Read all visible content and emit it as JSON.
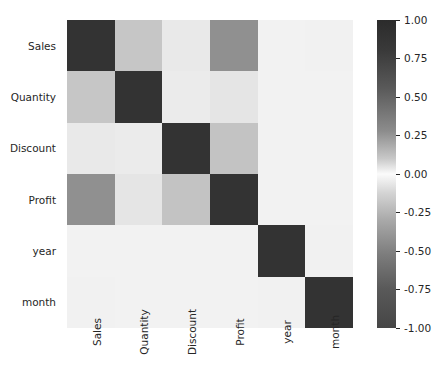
{
  "chart_data": {
    "type": "heatmap",
    "title": "",
    "xlabel": "",
    "ylabel": "",
    "categories": [
      "Sales",
      "Quantity",
      "Discount",
      "Profit",
      "year",
      "month"
    ],
    "x_tick_labels": [
      "Sales",
      "Quantity",
      "Discount",
      "Profit",
      "year",
      "month"
    ],
    "y_tick_labels": [
      "Sales",
      "Quantity",
      "Discount",
      "Profit",
      "year",
      "month"
    ],
    "colormap": "gray-diverging",
    "zlim": [
      -1.0,
      1.0
    ],
    "grid": false,
    "legend_position": "right",
    "colorbar": {
      "orientation": "vertical",
      "ticks": [
        "1.00",
        "0.75",
        "0.50",
        "0.25",
        "0.00",
        "-0.25",
        "-0.50",
        "-0.75",
        "-1.00"
      ],
      "tick_values": [
        1.0,
        0.75,
        0.5,
        0.25,
        0.0,
        -0.25,
        -0.5,
        -0.75,
        -1.0
      ],
      "vmin": -1.0,
      "vmax": 1.0,
      "high_color": "#2b2b2b",
      "mid_color": "#fbfbfb",
      "low_color": "#464646"
    },
    "rows": [
      {
        "label": "Sales",
        "values": [
          1.0,
          0.2,
          0.03,
          0.48,
          0.0,
          0.01
        ],
        "colors": [
          "#333333",
          "#c6c6c6",
          "#e9e9e9",
          "#909090",
          "#f2f2f2",
          "#f1f1f1"
        ]
      },
      {
        "label": "Quantity",
        "values": [
          0.2,
          1.0,
          0.01,
          0.06,
          0.0,
          0.0
        ],
        "colors": [
          "#c6c6c6",
          "#333333",
          "#ebebeb",
          "#e5e5e5",
          "#f2f2f2",
          "#f2f2f2"
        ]
      },
      {
        "label": "Discount",
        "values": [
          0.03,
          0.01,
          1.0,
          0.22,
          0.0,
          0.0
        ],
        "colors": [
          "#e9e9e9",
          "#ebebeb",
          "#333333",
          "#c3c3c3",
          "#f2f2f2",
          "#f2f2f2"
        ]
      },
      {
        "label": "Profit",
        "values": [
          0.48,
          0.06,
          0.22,
          1.0,
          0.0,
          0.0
        ],
        "colors": [
          "#909090",
          "#e5e5e5",
          "#c3c3c3",
          "#333333",
          "#f2f2f2",
          "#f2f2f2"
        ]
      },
      {
        "label": "year",
        "values": [
          0.0,
          0.0,
          0.0,
          0.0,
          1.0,
          0.01
        ],
        "colors": [
          "#f2f2f2",
          "#f2f2f2",
          "#f2f2f2",
          "#f2f2f2",
          "#333333",
          "#f1f1f1"
        ]
      },
      {
        "label": "month",
        "values": [
          0.01,
          0.0,
          0.0,
          0.0,
          0.01,
          1.0
        ],
        "colors": [
          "#f1f1f1",
          "#f2f2f2",
          "#f2f2f2",
          "#f2f2f2",
          "#f1f1f1",
          "#333333"
        ]
      }
    ]
  }
}
